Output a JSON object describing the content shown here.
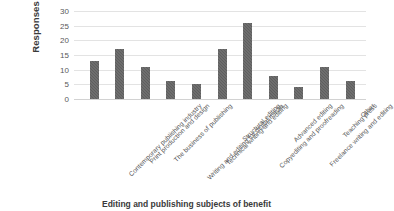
{
  "chart_data": {
    "type": "bar",
    "title": "",
    "xlabel": "Editing and publishing subjects of benefit",
    "ylabel": "Responses",
    "ylim": [
      0,
      30
    ],
    "yticks": [
      0,
      5,
      10,
      15,
      20,
      25,
      30
    ],
    "ytick_labels": [
      "0",
      "5",
      "10",
      "15",
      "20",
      "25",
      "30"
    ],
    "grid": true,
    "legend": false,
    "bar_color": "#5e5e5e",
    "grid_color": "#e3e3e3",
    "categories": [
      "Contemporary publishing industry",
      "Print production and design",
      "The business of publishing",
      "Writing and editing for digital media",
      "Technical writing and editing",
      "Structural editing",
      "Copyediting and proofreading",
      "Advanced editing",
      "Freelance writing and editing",
      "Teaching press",
      "Other"
    ],
    "values": [
      13,
      17,
      11,
      6,
      5,
      17,
      26,
      8,
      4,
      11,
      6
    ]
  }
}
